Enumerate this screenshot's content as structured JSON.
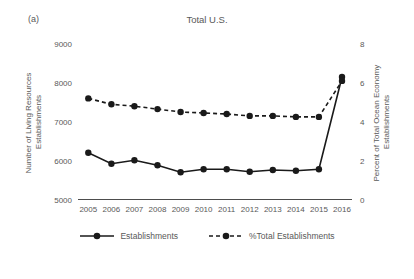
{
  "figure_label": "(a)",
  "colors": {
    "background": "#ffffff",
    "text": "#595959",
    "series_line": "#1a1a1a",
    "axis_line": "#4d4d4d"
  },
  "chart_data": {
    "type": "line",
    "title": "Total U.S.",
    "x": [
      2005,
      2006,
      2007,
      2008,
      2009,
      2010,
      2011,
      2012,
      2013,
      2014,
      2015,
      2016
    ],
    "xlabel": "",
    "ylabel": "Number of Living Resources Establishments",
    "ylabel_lines": [
      "Number of Living Resources",
      "Establishments"
    ],
    "y2label": "Percent of Total Ocean Economy Establishments",
    "y2label_lines": [
      "Percent of Total Ocean Economy",
      "Establishments"
    ],
    "ylim": [
      5000,
      9000
    ],
    "yticks": [
      9000,
      8000,
      7000,
      6000,
      5000
    ],
    "y2lim": [
      0,
      8
    ],
    "y2ticks": [
      8,
      6,
      4,
      2,
      0
    ],
    "grid": false,
    "legend_position": "bottom",
    "series": [
      {
        "name": "Establishments",
        "axis": "left",
        "style": "solid",
        "marker": "circle",
        "color": "#1a1a1a",
        "values": [
          6200,
          5920,
          6010,
          5880,
          5700,
          5780,
          5780,
          5715,
          5760,
          5740,
          5780,
          8150
        ]
      },
      {
        "name": "%Total Establishments",
        "axis": "right",
        "style": "dashed",
        "marker": "circle",
        "color": "#1a1a1a",
        "values": [
          5.2,
          4.9,
          4.8,
          4.65,
          4.5,
          4.45,
          4.4,
          4.3,
          4.3,
          4.25,
          4.25,
          6.1
        ]
      }
    ]
  }
}
